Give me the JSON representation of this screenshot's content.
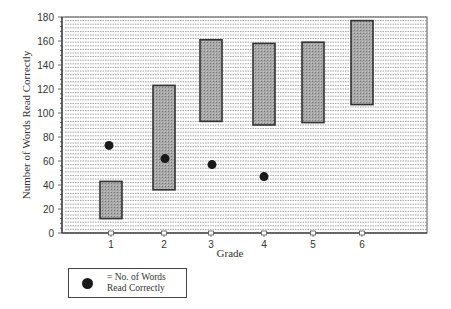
{
  "chart_data": {
    "type": "bar",
    "subtype": "floating-range-with-points",
    "title": "",
    "xlabel": "Grade",
    "ylabel": "Number of Words Read Correctly",
    "categories": [
      "1",
      "2",
      "3",
      "4",
      "5",
      "6"
    ],
    "yticks": [
      0,
      20,
      40,
      60,
      80,
      100,
      120,
      140,
      160,
      180
    ],
    "ylim": [
      0,
      180
    ],
    "grid": "dense horizontal dashed lines",
    "series": [
      {
        "name": "Range",
        "type": "floating-bar",
        "low": [
          12,
          36,
          93,
          90,
          92,
          107
        ],
        "high": [
          43,
          123,
          161,
          158,
          159,
          177
        ]
      },
      {
        "name": "= No. of Words Read Correctly",
        "type": "scatter",
        "values": [
          73,
          62,
          57,
          47,
          null,
          null
        ]
      }
    ],
    "legend": {
      "position": "bottom-left",
      "entries": [
        "= No. of Words Read Correctly"
      ]
    },
    "colors": {
      "bar_fill": "#9a9a9a",
      "bar_edge": "#333333",
      "dot": "#1a1a1a",
      "grid": "#8a8a8a"
    }
  },
  "legend_label": "= No. of Words Read Correctly"
}
